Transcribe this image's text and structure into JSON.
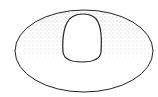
{
  "figure": {
    "description": "Stippled line drawing of a flat ellipse with a raised dome-shaped opening near the top center",
    "colors": {
      "background": "#ffffff",
      "outline": "#222222",
      "stipple": "#555555"
    }
  }
}
